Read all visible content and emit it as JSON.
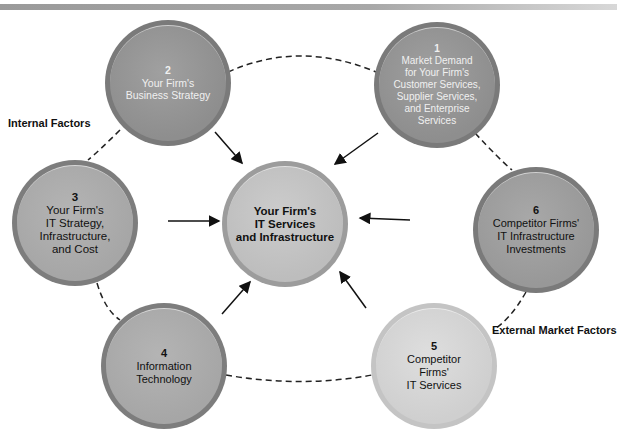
{
  "diagram": {
    "center": {
      "line1": "Your Firm's",
      "line2": "IT Services",
      "line3": "and Infrastructure"
    },
    "nodes": [
      {
        "num": "1",
        "lines": [
          "Market Demand",
          "for Your Firm's",
          "Customer Services,",
          "Supplier Services,",
          "and Enterprise",
          "Services"
        ]
      },
      {
        "num": "2",
        "lines": [
          "Your Firm's",
          "Business Strategy"
        ]
      },
      {
        "num": "3",
        "lines": [
          "Your Firm's",
          "IT Strategy,",
          "Infrastructure,",
          "and Cost"
        ]
      },
      {
        "num": "4",
        "lines": [
          "Information",
          "Technology"
        ]
      },
      {
        "num": "5",
        "lines": [
          "Competitor",
          "Firms'",
          "IT Services"
        ]
      },
      {
        "num": "6",
        "lines": [
          "Competitor Firms'",
          "IT Infrastructure",
          "Investments"
        ]
      }
    ],
    "labels": {
      "internal": "Internal Factors",
      "external": "External Market Factors"
    }
  }
}
